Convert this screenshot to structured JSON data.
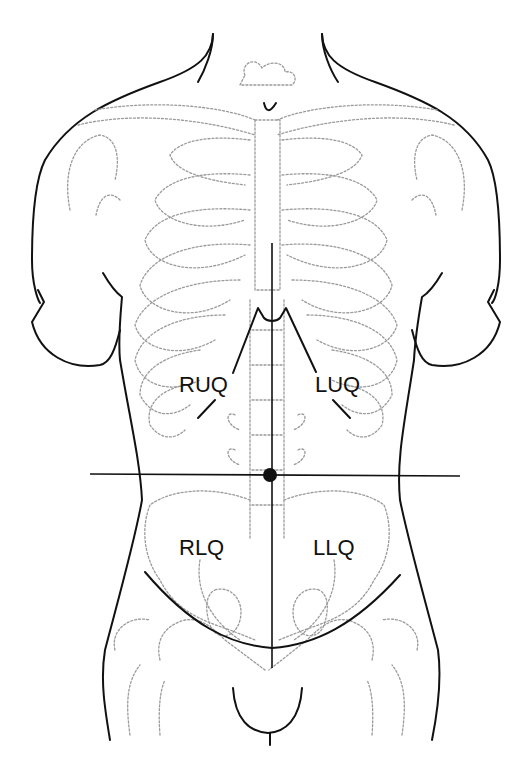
{
  "diagram": {
    "quadrants": [
      {
        "label": "RUQ"
      },
      {
        "label": "LUQ"
      },
      {
        "label": "RLQ"
      },
      {
        "label": "LLQ"
      }
    ],
    "reference_point": "umbilicus"
  }
}
